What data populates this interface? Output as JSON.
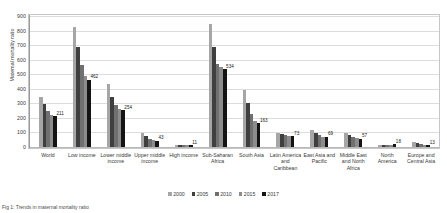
{
  "chart_data": {
    "type": "bar",
    "title": "",
    "xlabel": "",
    "ylabel": "Maternal mortality ratio",
    "ylim": [
      0,
      900
    ],
    "ytick_step": 100,
    "yticks": [
      "0",
      "100",
      "200",
      "300",
      "400",
      "500",
      "600",
      "700",
      "800",
      "900"
    ],
    "grid": true,
    "legend_position": "bottom",
    "categories": [
      "World",
      "Low income",
      "Lower middle income",
      "Upper middle income",
      "High income",
      "Sub-Saharan Africa",
      "South Asia",
      "Latin America and Caribbean",
      "East Asia and Pacific",
      "Middle East and North Africa",
      "North America",
      "Europe and Central Asia"
    ],
    "series": [
      {
        "name": "2000",
        "color": "#a6a6a6",
        "values": [
          342,
          824,
          432,
          96,
          13,
          846,
          395,
          97,
          116,
          96,
          12,
          33
        ]
      },
      {
        "name": "2005",
        "color": "#3f3f3f",
        "values": [
          296,
          689,
          343,
          73,
          12,
          690,
          301,
          88,
          96,
          81,
          13,
          26
        ]
      },
      {
        "name": "2010",
        "color": "#707070",
        "values": [
          248,
          565,
          286,
          57,
          11,
          570,
          226,
          81,
          80,
          69,
          14,
          21
        ]
      },
      {
        "name": "2015",
        "color": "#8c8c8c",
        "values": [
          219,
          489,
          264,
          46,
          11,
          551,
          176,
          75,
          71,
          60,
          17,
          15
        ]
      },
      {
        "name": "2017",
        "color": "#141414",
        "values": [
          211,
          462,
          254,
          43,
          11,
          534,
          163,
          73,
          69,
          57,
          18,
          13
        ]
      }
    ],
    "data_labels": {
      "World": "211",
      "Low income": "462",
      "Lower middle income": "254",
      "Upper middle income": "43",
      "High income": "11",
      "Sub-Saharan Africa": "534",
      "South Asia": "163",
      "Latin America and Caribbean": "73",
      "East Asia and Pacific": "69",
      "Middle East and North Africa": "57",
      "North America": "18",
      "Europe and Central Asia": "13"
    }
  },
  "caption": {
    "text": "Fig 1: Trends in maternal mortality ratio"
  }
}
